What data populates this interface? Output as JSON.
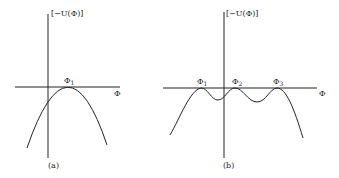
{
  "figure": {
    "panel_a": {
      "caption": "(a)",
      "y_axis_label": "[−U(Φ)]",
      "x_axis_label": "Φ",
      "points": [
        {
          "label": "Φ",
          "sub": "1"
        }
      ]
    },
    "panel_b": {
      "caption": "(b)",
      "y_axis_label": "[−U(Φ)]",
      "x_axis_label": "Φ",
      "points": [
        {
          "label": "Φ",
          "sub": "1"
        },
        {
          "label": "Φ",
          "sub": "2"
        },
        {
          "label": "Φ",
          "sub": "3"
        }
      ]
    },
    "colors": {
      "ink": "#222222",
      "background": "#ffffff"
    }
  }
}
